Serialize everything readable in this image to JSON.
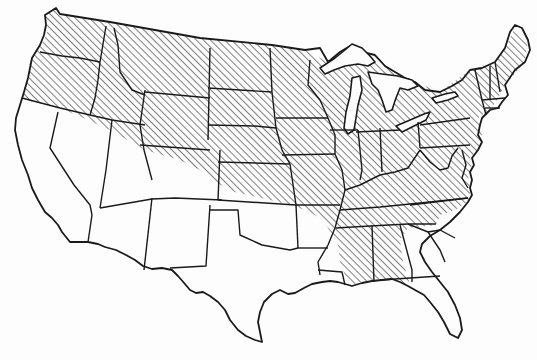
{
  "map": {
    "subject": "Contiguous United States",
    "style": "black-and-white line map with state boundaries",
    "background_color": "#fdfdfd",
    "line_color": "#1a1a1a",
    "hatch_color": "#3a3a3a",
    "regions": [
      {
        "name": "hatched-region",
        "fill": "diagonal-hatch",
        "description": "Northern and eastern states above a diagonal boundary from northern California across the southern Rockies to the Mississippi, extending south through Mississippi, Alabama and western Georgia to the Gulf coast",
        "states": [
          "WA",
          "OR",
          "ID",
          "MT",
          "WY",
          "ND",
          "SD",
          "NE",
          "KS",
          "MN",
          "IA",
          "MO",
          "WI",
          "IL",
          "MI",
          "IN",
          "OH",
          "KY",
          "TN",
          "AR",
          "MS",
          "AL",
          "WV",
          "VA",
          "PA",
          "NY",
          "VT",
          "NH",
          "ME",
          "MA",
          "CT",
          "RI",
          "NJ",
          "DE",
          "MD"
        ]
      },
      {
        "name": "unhatched-region",
        "fill": "none",
        "states": [
          "CA",
          "NV",
          "UT",
          "AZ",
          "NM",
          "TX",
          "OK",
          "LA",
          "FL",
          "GA",
          "SC",
          "NC"
        ]
      }
    ],
    "labels": []
  }
}
